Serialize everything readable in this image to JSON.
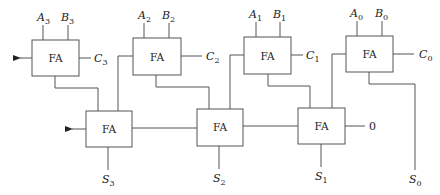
{
  "diagram": {
    "title": "",
    "type": "ripple-carry adder of full adders",
    "top_row": [
      {
        "id": "fa3",
        "label": "FA",
        "in_a": "A",
        "in_a_sub": "3",
        "in_b": "B",
        "in_b_sub": "3",
        "carry": "C",
        "carry_sub": "3"
      },
      {
        "id": "fa2",
        "label": "FA",
        "in_a": "A",
        "in_a_sub": "2",
        "in_b": "B",
        "in_b_sub": "2",
        "carry": "C",
        "carry_sub": "2"
      },
      {
        "id": "fa1",
        "label": "FA",
        "in_a": "A",
        "in_a_sub": "1",
        "in_b": "B",
        "in_b_sub": "1",
        "carry": "C",
        "carry_sub": "1"
      },
      {
        "id": "fa0",
        "label": "FA",
        "in_a": "A",
        "in_a_sub": "0",
        "in_b": "B",
        "in_b_sub": "0",
        "carry": "C",
        "carry_sub": "0"
      }
    ],
    "bottom_row": [
      {
        "id": "fb3",
        "label": "FA",
        "sum": "S",
        "sum_sub": "3"
      },
      {
        "id": "fb2",
        "label": "FA",
        "sum": "S",
        "sum_sub": "2"
      },
      {
        "id": "fb1",
        "label": "FA",
        "sum": "S",
        "sum_sub": "1",
        "carry_in": "0"
      }
    ],
    "s0": {
      "label": "S",
      "sub": "0"
    }
  }
}
